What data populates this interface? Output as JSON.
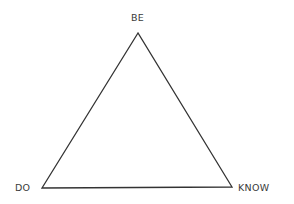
{
  "diagram": {
    "type": "triangle",
    "stroke_color": "#333333",
    "vertices": {
      "top": {
        "label": "BE",
        "x": 138,
        "y": 33
      },
      "bottom_left": {
        "label": "DO",
        "x": 42,
        "y": 188
      },
      "bottom_right": {
        "label": "KNOW",
        "x": 232,
        "y": 187
      }
    },
    "labels": {
      "top": "BE",
      "left": "DO",
      "right": "KNOW"
    }
  }
}
